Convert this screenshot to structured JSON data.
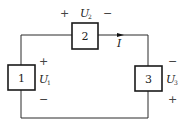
{
  "diagram": {
    "type": "circuit",
    "elements": [
      {
        "id": "1",
        "label": "1",
        "voltage": {
          "symbol": "U",
          "subscript": "1",
          "polarity_top": "+",
          "polarity_bottom": "−"
        }
      },
      {
        "id": "2",
        "label": "2",
        "voltage": {
          "symbol": "U",
          "subscript": "2",
          "polarity_left": "+",
          "polarity_right": "−"
        }
      },
      {
        "id": "3",
        "label": "3",
        "voltage": {
          "symbol": "U",
          "subscript": "3",
          "polarity_top": "−",
          "polarity_bottom": "+"
        }
      }
    ],
    "current": {
      "symbol": "I",
      "direction": "right"
    }
  }
}
